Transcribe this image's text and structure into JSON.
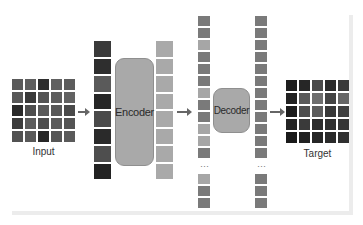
{
  "diagram": {
    "title": "",
    "input": {
      "label": "Input",
      "rows": 5,
      "cols": 5,
      "tiles": [
        "#5a5a5a",
        "#5e5e5e",
        "#2e2e2e",
        "#606060",
        "#5c5c5c",
        "#585858",
        "#3a3a3a",
        "#545454",
        "#5e5e5e",
        "#626262",
        "#2a2a2a",
        "#4e4e4e",
        "#5a5a5a",
        "#585858",
        "#4a4a4a",
        "#3c3c3c",
        "#5c5c5c",
        "#4e4e4e",
        "#5a5a5a",
        "#545454",
        "#525252",
        "#585858",
        "#262626",
        "#565656",
        "#5a5a5a"
      ]
    },
    "patches": {
      "count": 8,
      "tiles": [
        "#3a3a3a",
        "#2e2e2e",
        "#5a5a5a",
        "#262626",
        "#4a4a4a",
        "#2a2a2a",
        "#4e4e4e",
        "#222222"
      ]
    },
    "encoder": {
      "label": "Encoder"
    },
    "encoded_tokens": {
      "count": 8,
      "tiles": [
        "#a9a9a9",
        "#a9a9a9",
        "#a9a9a9",
        "#a9a9a9",
        "#a9a9a9",
        "#a9a9a9",
        "#a9a9a9",
        "#a9a9a9"
      ]
    },
    "decoder_input": {
      "top_tiles": [
        "#7a7a7a",
        "#7a7a7a",
        "#a6a6a6",
        "#7a7a7a",
        "#7a7a7a",
        "#7a7a7a",
        "#a6a6a6",
        "#7a7a7a",
        "#7a7a7a",
        "#a6a6a6",
        "#a6a6a6",
        "#7a7a7a"
      ],
      "ellipsis": "⋮",
      "bottom_tiles": [
        "#a6a6a6",
        "#7a7a7a",
        "#7a7a7a"
      ]
    },
    "decoder": {
      "label": "Decoder"
    },
    "decoder_output": {
      "top_tiles": [
        "#7a7a7a",
        "#7a7a7a",
        "#7a7a7a",
        "#7a7a7a",
        "#7a7a7a",
        "#7a7a7a",
        "#7a7a7a",
        "#7a7a7a",
        "#7a7a7a",
        "#7a7a7a",
        "#7a7a7a",
        "#7a7a7a"
      ],
      "ellipsis": "⋮",
      "bottom_tiles": [
        "#7a7a7a",
        "#7a7a7a",
        "#7a7a7a"
      ]
    },
    "target": {
      "label": "Target",
      "rows": 5,
      "cols": 5,
      "tiles": [
        "#1e1e1e",
        "#262626",
        "#4a4a4a",
        "#2a2a2a",
        "#3a3a3a",
        "#222222",
        "#5a5a5a",
        "#6e6e6e",
        "#444444",
        "#666666",
        "#1c1c1c",
        "#4e4e4e",
        "#5c5c5c",
        "#383838",
        "#404040",
        "#242424",
        "#3a3a3a",
        "#2c2c2c",
        "#2e2e2e",
        "#353535",
        "#1a1a1a",
        "#222222",
        "#262626",
        "#2a2a2a",
        "#303030"
      ]
    },
    "colors": {
      "box_fill": "#a9a9a9",
      "arrow": "#666666",
      "frame": "#ececec"
    }
  }
}
